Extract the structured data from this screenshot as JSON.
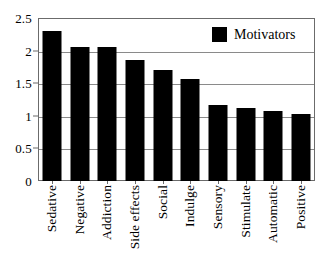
{
  "chart_data": {
    "type": "bar",
    "title": "",
    "xlabel": "",
    "ylabel": "",
    "ylim": [
      0,
      2.5
    ],
    "ytick_labels": [
      "0",
      "0.5",
      "1",
      "1.5",
      "2",
      "2.5"
    ],
    "ytick_values": [
      0,
      0.5,
      1,
      1.5,
      2,
      2.5
    ],
    "grid": true,
    "legend_position": "top-right",
    "categories": [
      "Sedative",
      "Negative",
      "Addiction",
      "Side effects",
      "Social",
      "Indulge",
      "Sensory",
      "Stimulate",
      "Automatic",
      "Positive"
    ],
    "series": [
      {
        "name": "Motivators",
        "color": "#000000",
        "values": [
          2.3,
          2.05,
          2.05,
          1.86,
          1.71,
          1.56,
          1.16,
          1.12,
          1.08,
          1.03
        ]
      }
    ]
  },
  "legend": {
    "entries": [
      {
        "label": "Motivators",
        "color": "#000000"
      }
    ]
  },
  "style": {
    "bar_color": "#000000",
    "grid_color": "#8a8a8a",
    "frame_color": "#6b6b6b",
    "background": "#ffffff"
  }
}
